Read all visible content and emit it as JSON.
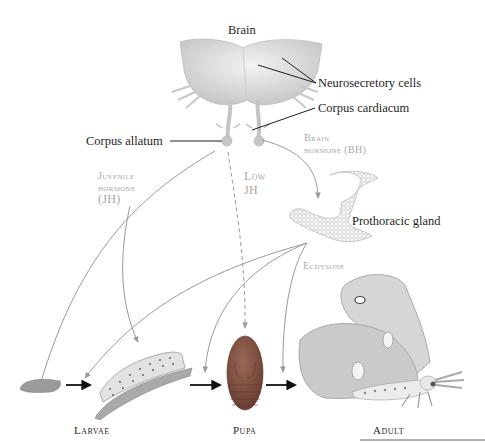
{
  "diagram": {
    "labels": {
      "brain": "Brain",
      "neurosecretory_cells": "Neurosecretory cells",
      "corpus_cardiacum": "Corpus cardiacum",
      "corpus_allatum": "Corpus allatum",
      "prothoracic_gland": "Prothoracic gland"
    },
    "hormones": {
      "juvenile_hormone_line1": "Juvenile",
      "juvenile_hormone_line2": "hormone",
      "juvenile_hormone_line3": "(JH)",
      "low_jh_line1": "Low",
      "low_jh_line2": "JH",
      "brain_hormone_line1": "Brain",
      "brain_hormone_line2": "hormone (BH)",
      "ecdysone": "Ecdysone"
    },
    "stages": {
      "larvae": "Larvae",
      "pupa": "Pupa",
      "adult": "Adult"
    },
    "colors": {
      "label_text": "#1e1e1e",
      "hormone_text": "#a8a8a8",
      "hormone_arrows": "#9a9a9a",
      "stage_arrows": "#111111",
      "pupa_fill": "#8a5a4a",
      "brain_fill": "#e4e4e4"
    }
  }
}
